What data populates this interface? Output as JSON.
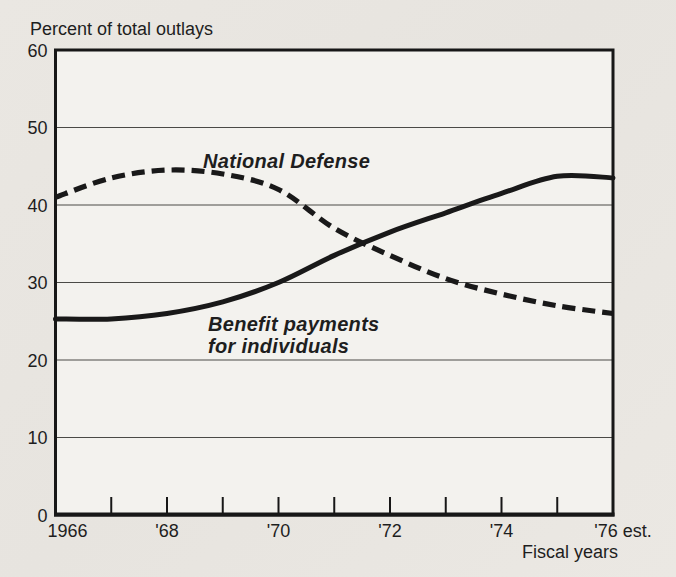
{
  "page": {
    "paper_color": "#e9e6e1",
    "plot_color": "#f3f2ee",
    "ink_color": "#191919"
  },
  "chart_data": {
    "type": "line",
    "title": "Percent of total outlays",
    "xlabel": "Fiscal years",
    "ylabel": "",
    "x": [
      1966,
      1967,
      1968,
      1969,
      1970,
      1971,
      1972,
      1973,
      1974,
      1975,
      1976
    ],
    "series": [
      {
        "name": "National Defense",
        "line_style": "dashed",
        "values": [
          41,
          43.5,
          44.5,
          44,
          42,
          37,
          33.5,
          30.5,
          28.5,
          27,
          26
        ]
      },
      {
        "name": "Benefit payments for individuals",
        "name_lines": [
          "Benefit payments",
          "for individuals"
        ],
        "line_style": "solid",
        "values": [
          25.3,
          25.3,
          26,
          27.5,
          30,
          33.5,
          36.5,
          39,
          41.5,
          43.7,
          43.5
        ]
      }
    ],
    "ylim": [
      0,
      60
    ],
    "y_ticks": [
      0,
      10,
      20,
      30,
      40,
      50,
      60
    ],
    "x_tick_labels": [
      {
        "year": 1966,
        "label": "1966"
      },
      {
        "year": 1968,
        "label": "'68"
      },
      {
        "year": 1970,
        "label": "'70"
      },
      {
        "year": 1972,
        "label": "'72"
      },
      {
        "year": 1974,
        "label": "'74"
      },
      {
        "year": 1976,
        "label": "'76 est."
      }
    ],
    "grid": "horizontal gridlines at every 10 units",
    "legend": "inline bold-italic labels beside each line"
  }
}
